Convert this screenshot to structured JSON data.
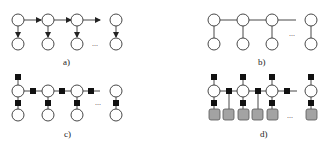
{
  "colors": {
    "stroke": "#333333",
    "node_fill": "#ffffff",
    "factor_fill": "#111111",
    "observed_fill": "#a3a3a3"
  },
  "panels": [
    {
      "id": "a",
      "label": "a)",
      "type": "directed-HMM",
      "columns": 4,
      "ellipsis": "..."
    },
    {
      "id": "b",
      "label": "b)",
      "type": "undirected-MRF",
      "columns": 4,
      "ellipsis": "..."
    },
    {
      "id": "c",
      "label": "c)",
      "type": "factor-graph",
      "columns": 4,
      "ellipsis": "..."
    },
    {
      "id": "d",
      "label": "d)",
      "type": "factor-graph-observed",
      "columns": 4,
      "observed_boxes": 6,
      "ellipsis": "..."
    }
  ]
}
